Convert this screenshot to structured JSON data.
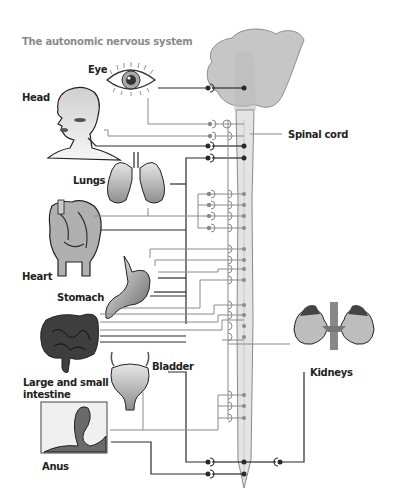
{
  "title": "The autonomic nervous system",
  "labels": {
    "eye": "Eye",
    "head": "Head",
    "spinal_cord": "Spinal cord",
    "lungs": "Lungs",
    "heart": "Heart",
    "stomach": "Stomach",
    "intestine_line1": "Large and small",
    "intestine_line2": "intestine",
    "bladder": "Bladder",
    "kidneys": "Kidneys",
    "anus": "Anus"
  },
  "colors": {
    "brain": "#c4c4c4",
    "spinal_cord": "#dcdcdc",
    "line_dark": "#2a2a2a",
    "line_grey": "#8a8a8a",
    "title": "#8a8a8a"
  }
}
